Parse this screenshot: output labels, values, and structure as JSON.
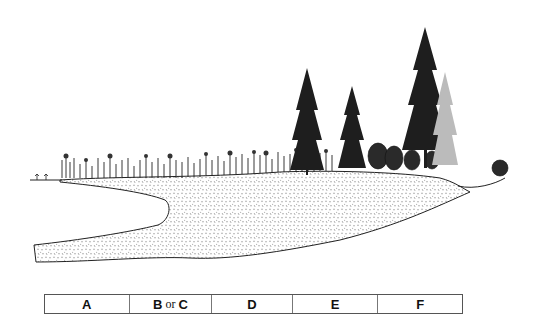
{
  "figure": {
    "colors": {
      "ink": "#1a1a1a",
      "peat_fill": "#f4f4f4",
      "background": "#ffffff"
    }
  },
  "zones": [
    {
      "id": "A",
      "label": "A",
      "width": 85
    },
    {
      "id": "BC",
      "label_b": "B",
      "label_or": "or",
      "label_c": "C",
      "width": 83
    },
    {
      "id": "D",
      "label": "D",
      "width": 81
    },
    {
      "id": "E",
      "label": "E",
      "width": 86
    },
    {
      "id": "F",
      "label": "F",
      "width": 84
    }
  ]
}
